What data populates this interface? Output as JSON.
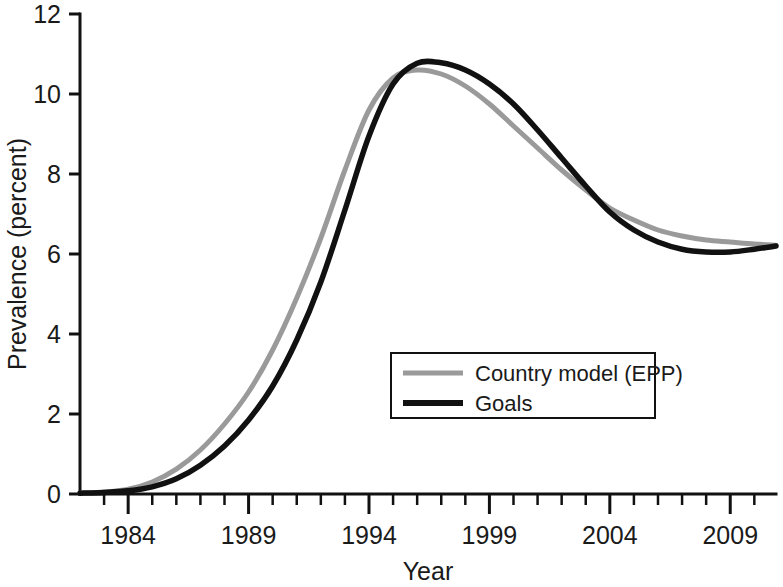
{
  "chart_data": {
    "type": "line",
    "title": "",
    "xlabel": "Year",
    "ylabel": "Prevalence (percent)",
    "xlim": [
      1982,
      2010.9
    ],
    "ylim": [
      0,
      12
    ],
    "grid": false,
    "legend_position": "center-right-inside",
    "x_major_ticks": [
      1984,
      1989,
      1994,
      1999,
      2004,
      2009
    ],
    "x_major_tick_labels": [
      "1984",
      "1989",
      "1994",
      "1999",
      "2004",
      "2009"
    ],
    "x_minor_tick_step": 1,
    "y_ticks": [
      0,
      2,
      4,
      6,
      8,
      10,
      12
    ],
    "y_tick_labels": [
      "0",
      "2",
      "4",
      "6",
      "8",
      "10",
      "12"
    ],
    "x": [
      1982,
      1983,
      1984,
      1985,
      1986,
      1987,
      1988,
      1989,
      1990,
      1991,
      1992,
      1993,
      1994,
      1995,
      1996,
      1997,
      1998,
      1999,
      2000,
      2001,
      2002,
      2003,
      2004,
      2005,
      2006,
      2007,
      2008,
      2009,
      2010,
      2010.9
    ],
    "series": [
      {
        "name": "Country model (EPP)",
        "color": "#9a9a9a",
        "width": 5,
        "values": [
          0.02,
          0.05,
          0.12,
          0.3,
          0.62,
          1.1,
          1.75,
          2.55,
          3.6,
          4.9,
          6.4,
          8.1,
          9.6,
          10.4,
          10.6,
          10.5,
          10.2,
          9.75,
          9.2,
          8.65,
          8.1,
          7.6,
          7.15,
          6.85,
          6.6,
          6.45,
          6.35,
          6.3,
          6.25,
          6.22
        ]
      },
      {
        "name": "Goals",
        "color": "#111111",
        "width": 5.5,
        "values": [
          0.02,
          0.04,
          0.08,
          0.18,
          0.38,
          0.72,
          1.2,
          1.85,
          2.7,
          3.85,
          5.3,
          7.1,
          8.95,
          10.25,
          10.77,
          10.78,
          10.6,
          10.25,
          9.75,
          9.1,
          8.4,
          7.7,
          7.05,
          6.6,
          6.3,
          6.12,
          6.05,
          6.05,
          6.12,
          6.2
        ]
      }
    ],
    "legend": [
      {
        "label": "Country model (EPP)",
        "color": "#9a9a9a",
        "width": 5
      },
      {
        "label": "Goals",
        "color": "#111111",
        "width": 6
      }
    ]
  }
}
